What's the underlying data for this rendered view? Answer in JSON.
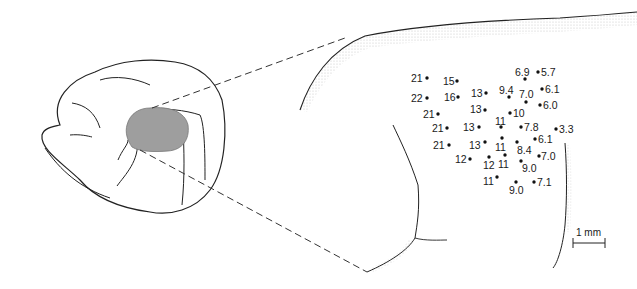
{
  "figure": {
    "type": "brain-map-diagram",
    "region_fill": "#9e9e9e",
    "line_color": "#222222",
    "stipple_color": "#b8b8b8"
  },
  "scale_bar": {
    "label": "1 mm"
  },
  "points": [
    {
      "label": "21",
      "dot": [
        427,
        78
      ],
      "text": [
        411,
        73
      ]
    },
    {
      "label": "15",
      "dot": [
        457,
        81
      ],
      "text": [
        443,
        76
      ]
    },
    {
      "label": "6.9",
      "dot": [
        525,
        79
      ],
      "text": [
        515,
        67
      ]
    },
    {
      "label": "5.7",
      "dot": [
        538,
        72
      ],
      "text": [
        541,
        67
      ]
    },
    {
      "label": "22",
      "dot": [
        427,
        98
      ],
      "text": [
        411,
        93
      ]
    },
    {
      "label": "16",
      "dot": [
        458,
        97
      ],
      "text": [
        444,
        92
      ]
    },
    {
      "label": "13",
      "dot": [
        486,
        93
      ],
      "text": [
        471,
        88
      ]
    },
    {
      "label": "9.4",
      "dot": [
        509,
        97
      ],
      "text": [
        499,
        85
      ]
    },
    {
      "label": "7.0",
      "dot": [
        526,
        102
      ],
      "text": [
        519,
        89
      ]
    },
    {
      "label": "6.1",
      "dot": [
        542,
        89
      ],
      "text": [
        545,
        84
      ]
    },
    {
      "label": "13",
      "dot": [
        485,
        110
      ],
      "text": [
        470,
        104
      ]
    },
    {
      "label": "10",
      "dot": [
        510,
        113
      ],
      "text": [
        513,
        108
      ]
    },
    {
      "label": "6.0",
      "dot": [
        540,
        105
      ],
      "text": [
        543,
        100
      ]
    },
    {
      "label": "21",
      "dot": [
        438,
        114
      ],
      "text": [
        423,
        109
      ]
    },
    {
      "label": "21",
      "dot": [
        447,
        128
      ],
      "text": [
        432,
        123
      ]
    },
    {
      "label": "13",
      "dot": [
        479,
        127
      ],
      "text": [
        463,
        122
      ]
    },
    {
      "label": "11",
      "dot": [
        501,
        127
      ],
      "text": [
        495,
        116
      ]
    },
    {
      "label": "7.8",
      "dot": [
        521,
        127
      ],
      "text": [
        524,
        122
      ]
    },
    {
      "label": "3.3",
      "dot": [
        556,
        129
      ],
      "text": [
        559,
        124
      ]
    },
    {
      "label": "21",
      "dot": [
        449,
        145
      ],
      "text": [
        433,
        140
      ]
    },
    {
      "label": "13",
      "dot": [
        485,
        142
      ],
      "text": [
        469,
        140
      ]
    },
    {
      "label": "11",
      "dot": [
        502,
        138
      ],
      "text": [
        495,
        142
      ]
    },
    {
      "label": "8.4",
      "dot": [
        517,
        142
      ],
      "text": [
        517,
        145
      ]
    },
    {
      "label": "6.1",
      "dot": [
        535,
        139
      ],
      "text": [
        538,
        134
      ]
    },
    {
      "label": "12",
      "dot": [
        470,
        159
      ],
      "text": [
        455,
        154
      ]
    },
    {
      "label": "12",
      "dot": [
        489,
        157
      ],
      "text": [
        483,
        160
      ]
    },
    {
      "label": "11",
      "dot": [
        505,
        155
      ],
      "text": [
        498,
        159
      ]
    },
    {
      "label": "9.0",
      "dot": [
        521,
        161
      ],
      "text": [
        522,
        163
      ]
    },
    {
      "label": "7.0",
      "dot": [
        539,
        156
      ],
      "text": [
        541,
        151
      ]
    },
    {
      "label": "11",
      "dot": [
        497,
        177
      ],
      "text": [
        483,
        176
      ]
    },
    {
      "label": "9.0",
      "dot": [
        516,
        182
      ],
      "text": [
        509,
        185
      ]
    },
    {
      "label": "7.1",
      "dot": [
        534,
        182
      ],
      "text": [
        537,
        177
      ]
    }
  ]
}
